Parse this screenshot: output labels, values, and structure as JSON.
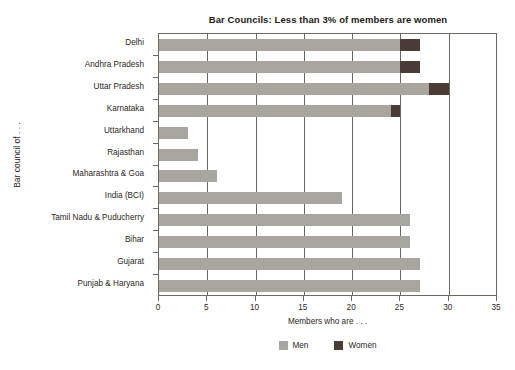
{
  "chart_data": {
    "type": "bar",
    "orientation": "horizontal",
    "stacked": true,
    "title": "Bar Councils: Less than 3% of members are women",
    "xlabel": "Members who are . . .",
    "ylabel": "Bar council of . . .",
    "xlim": [
      0,
      35
    ],
    "xticks": [
      0,
      5,
      10,
      15,
      20,
      25,
      30,
      35
    ],
    "grid": "vertical",
    "legend_position": "bottom-center",
    "categories": [
      "Delhi",
      "Andhra Pradesh",
      "Uttar Pradesh",
      "Karnataka",
      "Uttarkhand",
      "Rajasthan",
      "Maharashtra & Goa",
      "India (BCI)",
      "Tamil Nadu & Puducherry",
      "Bihar",
      "Gujarat",
      "Punjab & Haryana"
    ],
    "series": [
      {
        "name": "Men",
        "color": "#a8a49e",
        "values": [
          25,
          25,
          28,
          24,
          3,
          4,
          6,
          19,
          26,
          26,
          27,
          27
        ]
      },
      {
        "name": "Women",
        "color": "#4a3c35",
        "values": [
          2,
          2,
          2,
          1,
          0,
          0,
          0,
          0,
          0,
          0,
          0,
          0
        ]
      }
    ],
    "totals": [
      27,
      27,
      30,
      25,
      3,
      4,
      6,
      19,
      26,
      26,
      27,
      27
    ]
  },
  "legend": {
    "items": [
      {
        "label": "Men",
        "color": "#a8a49e"
      },
      {
        "label": "Women",
        "color": "#4a3c35"
      }
    ]
  },
  "axis": {
    "x_tick_labels": [
      "0",
      "5",
      "10",
      "15",
      "20",
      "25",
      "30",
      "35"
    ]
  }
}
